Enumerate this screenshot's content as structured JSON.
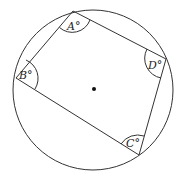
{
  "diagram": {
    "type": "cyclic-quadrilateral",
    "center_marked": true,
    "colors": {
      "stroke": "#333333",
      "center": "#111111"
    },
    "angles": [
      {
        "vertex": "A",
        "label": "A°"
      },
      {
        "vertex": "B",
        "label": "B°"
      },
      {
        "vertex": "C",
        "label": "C°"
      },
      {
        "vertex": "D",
        "label": "D°"
      }
    ]
  }
}
